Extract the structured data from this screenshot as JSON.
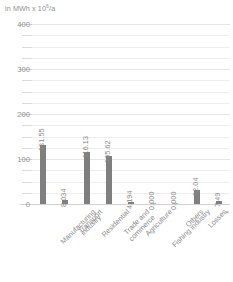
{
  "chart_data": {
    "type": "bar",
    "title": "",
    "subtitle": "",
    "xlabel": "",
    "ylabel": "in MWh x 10⁶/a",
    "ylabel_prefix": "in MWh x 10",
    "ylabel_exponent": "6",
    "ylabel_suffix": "/a",
    "ylim": [
      0,
      400
    ],
    "y_major_ticks": [
      0,
      100,
      200,
      300,
      400
    ],
    "y_major_tick_labels": [
      "0",
      "100",
      "200",
      "300",
      "400"
    ],
    "y_minor_tick_step": 25,
    "grid": true,
    "legend": "none",
    "bar_color": "#7f7f7f",
    "grid_color": "#eeeeee",
    "text_color": "#8a8a8a",
    "categories": [
      "Manufacturing\nindustry",
      "Transport",
      "Residential",
      "Trade and\ncommerce",
      "Agriculture",
      "Fishing industry",
      "Others",
      "Losses",
      "+"
    ],
    "values": [
      131.55,
      8.034,
      116.13,
      105.62,
      4.194,
      0.0,
      0.0,
      32.04,
      7.49
    ],
    "value_labels": [
      "131.55",
      "8.034",
      "116.13",
      "105.62",
      "4.194",
      "0.000",
      "0.000",
      "32.04",
      "7.49"
    ]
  }
}
